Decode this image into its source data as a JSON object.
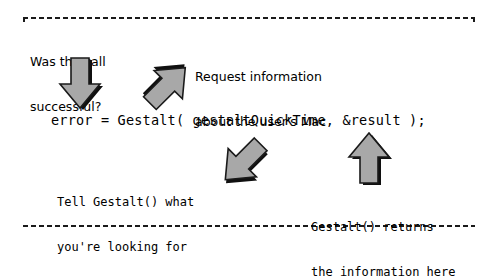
{
  "diagram": {
    "title_code": "error = Gestalt( gestaltQuickTime, &result );",
    "border_color": "#1a1a1a",
    "background_color": "#ffffff",
    "arrow_fill_color": "#a8a8a8",
    "arrow_outline_color": "#1a1a1a",
    "arrow_shadow_color": "#101010",
    "annotations": [
      {
        "id": "question-call-successful",
        "line1": "Was the call",
        "line2": "successful?",
        "font": "sans",
        "points_to": "error"
      },
      {
        "id": "request-information",
        "line1": "Request information",
        "line2": "about the user's Mac",
        "font": "sans",
        "points_to": "Gestalt("
      },
      {
        "id": "tell-gestalt",
        "line1": "Tell Gestalt() what",
        "line2": "you're looking for",
        "font": "mono",
        "points_to": "gestaltQuickTime"
      },
      {
        "id": "gestalt-returns",
        "line1": "Gestalt() returns",
        "line2": "the information here",
        "font": "mono",
        "points_to": "&result"
      }
    ],
    "arrows": [
      {
        "id": "arrow-down-to-error",
        "direction": "down",
        "angle_deg": 180
      },
      {
        "id": "arrow-downleft-to-gestalt",
        "direction": "down-left",
        "angle_deg": 225
      },
      {
        "id": "arrow-upright-to-selector",
        "direction": "up-right",
        "angle_deg": 45
      },
      {
        "id": "arrow-up-to-result",
        "direction": "up",
        "angle_deg": 0
      }
    ]
  }
}
